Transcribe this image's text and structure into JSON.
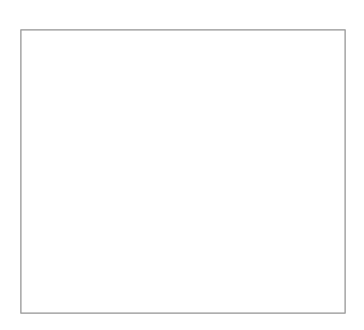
{
  "figure": {
    "title": "",
    "background_color": "#ffffff",
    "width": 364,
    "height": 330
  },
  "axes": {
    "name": "fractal-axes",
    "frame_color": "#9a9a9a",
    "face_color": "#ffffff",
    "left": 21,
    "top": 30,
    "right": 345,
    "bottom": 313,
    "xticks": [],
    "yticks": [],
    "grid": false
  },
  "palette": {
    "blue": "#2f8ecf",
    "purple": "#46273f",
    "orange": "#e8703a",
    "green": "#8cbf45",
    "yellow": "#f0c41b",
    "black": "#000000",
    "white": "#ffffff"
  },
  "chart_data": {
    "type": "scatter",
    "title": "",
    "xlabel": "",
    "ylabel": "",
    "grid": false,
    "legend": null,
    "geometry": {
      "base_left_x": 60,
      "base_right_x": 282,
      "base_y": 313,
      "apex_x": 171,
      "apex_y": 121,
      "depth": 3
    },
    "shapes": [
      {
        "id": "top",
        "label": "top-subtriangle",
        "fill": "#46273f",
        "inverted_fill": "#2f8ecf",
        "apex_x": 171,
        "apex_y": 121,
        "half_width": 55.5,
        "height": 96
      },
      {
        "id": "left",
        "label": "left-subtriangle",
        "fill": "#2f8ecf",
        "inverted_fill": "#ffffff",
        "apex_x": 115.5,
        "apex_y": 217,
        "half_width": 55.5,
        "height": 96
      },
      {
        "id": "middle",
        "label": "middle-subtriangle",
        "fill": "#e8703a",
        "inverted_fill": "#2f8ecf",
        "apex_x": 171,
        "apex_y": 217,
        "half_width": 39,
        "height": 68
      },
      {
        "id": "right",
        "label": "right-subtriangle",
        "fill": "#8cbf45",
        "inverted_fill": "#46273f",
        "apex_x": 226.5,
        "apex_y": 217,
        "half_width": 39,
        "height": 68
      }
    ]
  }
}
